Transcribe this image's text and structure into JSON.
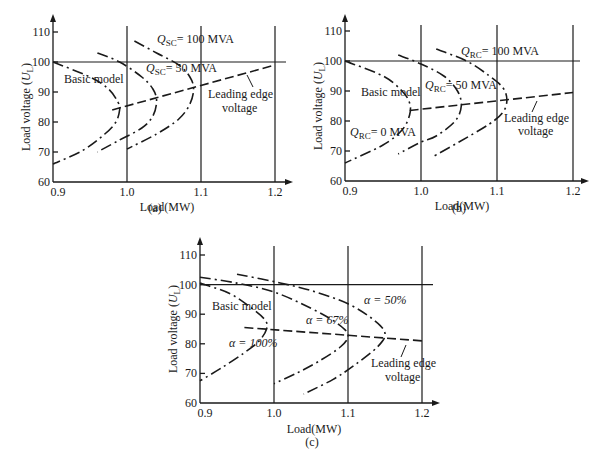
{
  "figure": {
    "captions": [
      "(a)",
      "(b)",
      "(c)"
    ]
  },
  "chart_data": [
    {
      "type": "line",
      "panel": "(a)",
      "title": "",
      "xlabel": "Load(MW)",
      "ylabel": "Load voltage (U_L)",
      "ylabel_main": "Load voltage (",
      "ylabel_sym": "U",
      "ylabel_sub": "L",
      "ylabel_close": ")",
      "xlim": [
        0.9,
        1.22
      ],
      "ylim": [
        60,
        113
      ],
      "xticks": [
        "0.9",
        "1.0",
        "1.1",
        "1.2"
      ],
      "yticks": [
        "60",
        "70",
        "80",
        "90",
        "100",
        "110"
      ],
      "grid": {
        "vertical": [
          1.0,
          1.1,
          1.2
        ],
        "horizontal": [
          100
        ]
      },
      "series": [
        {
          "name": "Basic model",
          "style": "dash-dot",
          "points": [
            [
              0.9,
              100
            ],
            [
              0.95,
              95
            ],
            [
              0.975,
              91
            ],
            [
              0.988,
              86.5
            ],
            [
              0.99,
              84
            ],
            [
              0.985,
              80
            ],
            [
              0.97,
              76
            ],
            [
              0.94,
              70.5
            ],
            [
              0.9,
              66
            ]
          ]
        },
        {
          "name": "Q_SC = 50 MVA",
          "style": "dash-dot",
          "points": [
            [
              0.96,
              103
            ],
            [
              0.99,
              100
            ],
            [
              1.02,
              95
            ],
            [
              1.035,
              91
            ],
            [
              1.04,
              87
            ],
            [
              1.035,
              82
            ],
            [
              1.02,
              78
            ],
            [
              0.99,
              74
            ],
            [
              0.96,
              70
            ]
          ]
        },
        {
          "name": "Q_SC = 100 MVA",
          "style": "dash-dot",
          "points": [
            [
              1.01,
              107
            ],
            [
              1.04,
              103
            ],
            [
              1.07,
              99
            ],
            [
              1.085,
              95
            ],
            [
              1.09,
              91
            ],
            [
              1.085,
              86
            ],
            [
              1.07,
              81
            ],
            [
              1.04,
              76
            ],
            [
              1.0,
              71
            ]
          ]
        },
        {
          "name": "Leading edge voltage",
          "style": "dashed",
          "points": [
            [
              0.98,
              84
            ],
            [
              1.2,
              99
            ]
          ]
        }
      ],
      "annotations": {
        "basic": "Basic model",
        "q50_sym": "Q",
        "q50_sub": "SC",
        "q50_val": "= 50 MVA",
        "q100_sym": "Q",
        "q100_sub": "SC",
        "q100_val": "= 100 MVA",
        "edge_line1": "Leading edge",
        "edge_line2": "voltage"
      }
    },
    {
      "type": "line",
      "panel": "(b)",
      "title": "",
      "xlabel": "Load(MW)",
      "ylabel": "Load voltage (U_L)",
      "xlim": [
        0.9,
        1.22
      ],
      "ylim": [
        60,
        113
      ],
      "xticks": [
        "0.9",
        "1.0",
        "1.1",
        "1.2"
      ],
      "yticks": [
        "60",
        "70",
        "80",
        "90",
        "100",
        "110"
      ],
      "grid": {
        "vertical": [
          1.0,
          1.1,
          1.2
        ],
        "horizontal": [
          100
        ]
      },
      "series": [
        {
          "name": "Q_RC = 0 MVA (Basic model)",
          "style": "dash-dot",
          "points": [
            [
              0.9,
              100
            ],
            [
              0.95,
              95
            ],
            [
              0.975,
              90
            ],
            [
              0.985,
              86
            ],
            [
              0.985,
              82
            ],
            [
              0.975,
              77
            ],
            [
              0.95,
              72
            ],
            [
              0.9,
              66
            ]
          ]
        },
        {
          "name": "Q_RC = 50 MVA",
          "style": "dash-dot",
          "points": [
            [
              0.97,
              102
            ],
            [
              1.0,
              99
            ],
            [
              1.03,
              95
            ],
            [
              1.048,
              90
            ],
            [
              1.053,
              85
            ],
            [
              1.045,
              80
            ],
            [
              1.02,
              75
            ],
            [
              1.0,
              73
            ],
            [
              0.97,
              69
            ]
          ]
        },
        {
          "name": "Q_RC = 100 MVA",
          "style": "dash-dot",
          "points": [
            [
              1.02,
              104
            ],
            [
              1.06,
              100
            ],
            [
              1.09,
              95
            ],
            [
              1.108,
              91
            ],
            [
              1.113,
              87
            ],
            [
              1.108,
              83
            ],
            [
              1.09,
              79
            ],
            [
              1.05,
              73
            ],
            [
              1.015,
              68
            ]
          ]
        },
        {
          "name": "Leading edge voltage",
          "style": "dashed",
          "points": [
            [
              0.985,
              83.5
            ],
            [
              1.2,
              89.5
            ]
          ]
        }
      ],
      "annotations": {
        "basic": "Basic model",
        "q0_sym": "Q",
        "q0_sub": "RC",
        "q0_val": "= 0 MVA",
        "q50_sym": "Q",
        "q50_sub": "RC",
        "q50_val": "= 50 MVA",
        "q100_sym": "Q",
        "q100_sub": "RC",
        "q100_val": "= 100 MVA",
        "edge_line1": "Leading edge",
        "edge_line2": "voltage"
      }
    },
    {
      "type": "line",
      "panel": "(c)",
      "title": "",
      "xlabel": "Load(MW)",
      "ylabel": "Load voltage (U_L)",
      "xlim": [
        0.9,
        1.22
      ],
      "ylim": [
        60,
        113
      ],
      "xticks": [
        "0.9",
        "1.0",
        "1.1",
        "1.2"
      ],
      "yticks": [
        "60",
        "70",
        "80",
        "90",
        "100",
        "110"
      ],
      "grid": {
        "vertical": [
          1.0,
          1.1,
          1.2
        ],
        "horizontal": [
          100
        ]
      },
      "series": [
        {
          "name": "α = 100% (Basic model)",
          "style": "dash-dot",
          "points": [
            [
              0.9,
              100.5
            ],
            [
              0.94,
              97
            ],
            [
              0.97,
              92
            ],
            [
              0.988,
              88
            ],
            [
              0.99,
              85
            ],
            [
              0.98,
              81
            ],
            [
              0.96,
              77
            ],
            [
              0.93,
              72
            ],
            [
              0.9,
              67.5
            ]
          ]
        },
        {
          "name": "α = 67%",
          "style": "dash-dot",
          "points": [
            [
              0.9,
              102.5
            ],
            [
              0.95,
              100.5
            ],
            [
              1.0,
              97.5
            ],
            [
              1.05,
              92
            ],
            [
              1.085,
              87
            ],
            [
              1.1,
              83
            ],
            [
              1.09,
              79
            ],
            [
              1.06,
              74
            ],
            [
              1.03,
              70
            ],
            [
              1.0,
              66.5
            ]
          ]
        },
        {
          "name": "α = 50%",
          "style": "dash-dot",
          "points": [
            [
              0.95,
              103.5
            ],
            [
              1.0,
              101
            ],
            [
              1.05,
              98
            ],
            [
              1.1,
              93.5
            ],
            [
              1.135,
              88
            ],
            [
              1.15,
              83.5
            ],
            [
              1.14,
              79
            ],
            [
              1.11,
              73
            ],
            [
              1.08,
              68
            ],
            [
              1.04,
              63
            ]
          ]
        },
        {
          "name": "Leading edge voltage",
          "style": "dashed",
          "points": [
            [
              0.96,
              85.5
            ],
            [
              1.2,
              81
            ]
          ]
        }
      ],
      "annotations": {
        "basic": "Basic model",
        "a100": "α = 100%",
        "a67": "α = 67%",
        "a50": "α = 50%",
        "edge_line1": "Leading edge",
        "edge_line2": "voltage"
      }
    }
  ]
}
